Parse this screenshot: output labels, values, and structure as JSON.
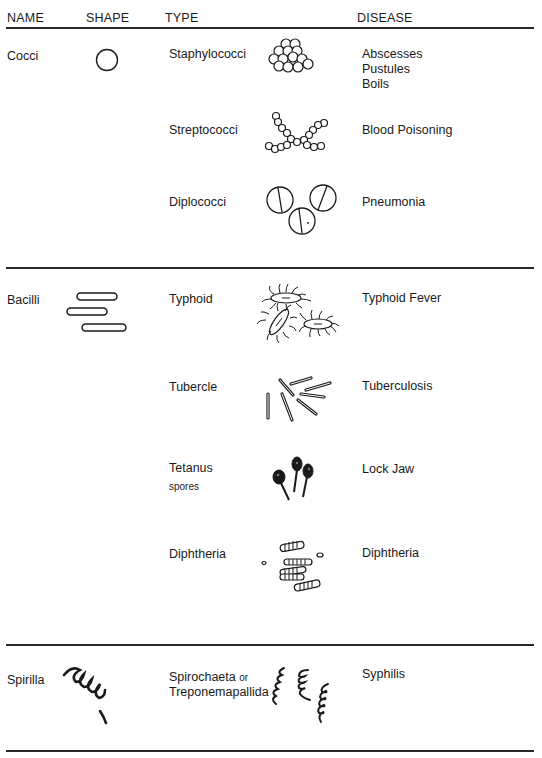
{
  "headers": {
    "name": "NAME",
    "shape": "SHAPE",
    "type": "TYPE",
    "disease": "DISEASE"
  },
  "groups": [
    {
      "name": "Cocci",
      "shape_icon": "circle-icon",
      "rows": [
        {
          "type": "Staphylococci",
          "icon": "staphylococci-cluster-icon",
          "disease": [
            "Abscesses",
            "Pustules",
            "Boils"
          ]
        },
        {
          "type": "Streptococci",
          "icon": "streptococci-chain-icon",
          "disease": [
            "Blood Poisoning"
          ]
        },
        {
          "type": "Diplococci",
          "icon": "diplococci-pairs-icon",
          "disease": [
            "Pneumonia"
          ]
        }
      ]
    },
    {
      "name": "Bacilli",
      "shape_icon": "rods-icon",
      "rows": [
        {
          "type": "Typhoid",
          "icon": "typhoid-flagellated-icon",
          "disease": [
            "Typhoid Fever"
          ]
        },
        {
          "type": "Tubercle",
          "icon": "tubercle-rods-icon",
          "disease": [
            "Tuberculosis"
          ]
        },
        {
          "type": "Tetanus",
          "type_sub": "spores",
          "icon": "tetanus-spores-icon",
          "disease": [
            "Lock Jaw"
          ]
        },
        {
          "type": "Diphtheria",
          "icon": "diphtheria-segmented-icon",
          "disease": [
            "Diphtheria"
          ]
        }
      ]
    },
    {
      "name": "Spirilla",
      "shape_icon": "spiral-icon",
      "rows": [
        {
          "type": "Spirochaeta",
          "type_or": "or",
          "type_line2": "Treponemapallida",
          "icon": "spirochaeta-icon",
          "disease": [
            "Syphilis"
          ]
        }
      ]
    }
  ]
}
